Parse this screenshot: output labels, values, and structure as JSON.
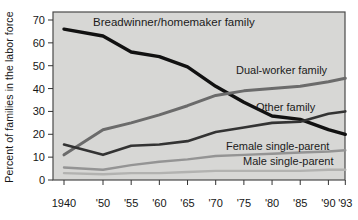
{
  "chart_data": {
    "type": "line",
    "title": "",
    "xlabel": "",
    "ylabel": "Percent of families in the labor force",
    "ylim": [
      0,
      70
    ],
    "yticks": [
      0,
      10,
      20,
      30,
      40,
      50,
      60,
      70
    ],
    "x": [
      1940,
      1950,
      1955,
      1960,
      1965,
      1970,
      1975,
      1980,
      1985,
      1990,
      1993
    ],
    "x_labels": [
      "1940",
      "'50",
      "'55",
      "'60",
      "'65",
      "'70",
      "'75",
      "'80",
      "'85",
      "'90",
      "'93"
    ],
    "grid": false,
    "legend": "inline-labels",
    "plot_bg": "#d7d7d5",
    "axis_color": "#4a4a4a",
    "series": [
      {
        "name": "Breadwinner/homemaker family",
        "color": "#111111",
        "values": [
          66,
          63,
          56,
          54,
          49.5,
          41,
          34,
          28,
          26.5,
          22,
          20
        ]
      },
      {
        "name": "Dual-worker family",
        "color": "#6b6b6b",
        "values": [
          11,
          22,
          25,
          28.5,
          32.5,
          37,
          39,
          40,
          41,
          43,
          44.5
        ]
      },
      {
        "name": "Other family",
        "color": "#333333",
        "values": [
          15.5,
          11,
          15,
          15.5,
          17,
          21,
          23,
          25,
          25.5,
          29,
          30
        ]
      },
      {
        "name": "Female single-parent",
        "color": "#949494",
        "values": [
          5.5,
          4.5,
          6.5,
          8,
          9,
          10.5,
          11,
          11.5,
          12,
          12.5,
          13
        ]
      },
      {
        "name": "Male single-parent",
        "color": "#b2b2b0",
        "values": [
          3,
          2.5,
          3,
          3,
          3.5,
          4,
          4,
          4,
          4,
          4.5,
          4.5
        ]
      }
    ]
  }
}
